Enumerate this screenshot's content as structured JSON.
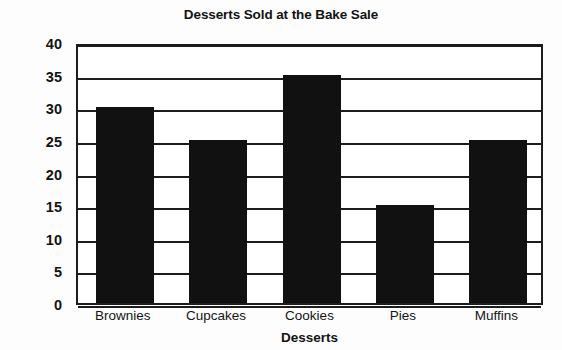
{
  "chart_data": {
    "type": "bar",
    "title": "Desserts Sold at the Bake Sale",
    "xlabel": "Desserts",
    "ylabel": "Number Sold",
    "categories": [
      "Brownies",
      "Cupcakes",
      "Cookies",
      "Pies",
      "Muffins"
    ],
    "values": [
      30,
      25,
      35,
      15,
      25
    ],
    "ylim": [
      0,
      40
    ],
    "ytick_step": 5,
    "yticks": [
      40,
      35,
      30,
      25,
      20,
      15,
      10,
      5,
      0
    ],
    "grid": true,
    "legend": null,
    "bar_color": "#111111",
    "frame_color": "#1c1c1c",
    "background": "#ffffff"
  }
}
